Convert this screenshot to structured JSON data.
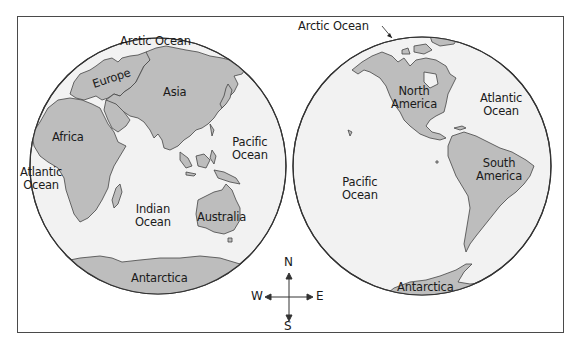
{
  "colors": {
    "ocean": "#f2f2f2",
    "land": "#bdbdbd",
    "outline": "#333333",
    "frame": "#4a4a4a"
  },
  "eastern_hemisphere": {
    "labels": {
      "arctic_ocean": "Arctic Ocean",
      "europe": "Europe",
      "asia": "Asia",
      "africa": "Africa",
      "pacific_ocean_line1": "Pacific",
      "pacific_ocean_line2": "Ocean",
      "atlantic_ocean_line1": "Atlantic",
      "atlantic_ocean_line2": "Ocean",
      "indian_ocean_line1": "Indian",
      "indian_ocean_line2": "Ocean",
      "australia": "Australia",
      "antarctica": "Antarctica"
    }
  },
  "western_hemisphere": {
    "labels": {
      "arctic_ocean": "Arctic Ocean",
      "north_america_line1": "North",
      "north_america_line2": "America",
      "atlantic_ocean_line1": "Atlantic",
      "atlantic_ocean_line2": "Ocean",
      "south_america_line1": "South",
      "south_america_line2": "America",
      "pacific_ocean_line1": "Pacific",
      "pacific_ocean_line2": "Ocean",
      "antarctica": "Antarctica"
    }
  },
  "compass": {
    "north": "N",
    "south": "S",
    "east": "E",
    "west": "W"
  }
}
